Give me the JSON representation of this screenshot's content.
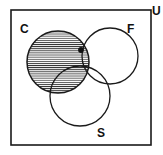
{
  "figure": {
    "name": "three-set-venn-diagram",
    "background_color": "#ffffff",
    "stroke_color": "#1a1a1a",
    "shade_color": "#9a9a9a",
    "width": 163,
    "height": 155
  },
  "universe": {
    "label": "U",
    "label_x": 152,
    "label_y": 15,
    "rect": {
      "x": 11,
      "y": 10,
      "width": 140,
      "height": 135
    },
    "stroke_width": 1.6
  },
  "sets": [
    {
      "id": "C",
      "label": "C",
      "label_x": 20,
      "label_y": 33,
      "cx": 58,
      "cy": 62,
      "r": 31,
      "shaded": true,
      "shading": "horizontal-hatch"
    },
    {
      "id": "F",
      "label": "F",
      "label_x": 127,
      "label_y": 33,
      "cx": 110,
      "cy": 56,
      "r": 28,
      "shaded": false,
      "shading": "none"
    },
    {
      "id": "S",
      "label": "S",
      "label_x": 97,
      "label_y": 137,
      "cx": 80,
      "cy": 96,
      "r": 30,
      "shaded": false,
      "shading": "none"
    }
  ],
  "markers": [
    {
      "id": "element-point",
      "name": "element-dot",
      "x": 81,
      "y": 50,
      "r": 2.9,
      "region": "C and F"
    }
  ],
  "hatch": {
    "spacing": 2.1,
    "line_width": 0.85,
    "angle_deg": 0
  }
}
